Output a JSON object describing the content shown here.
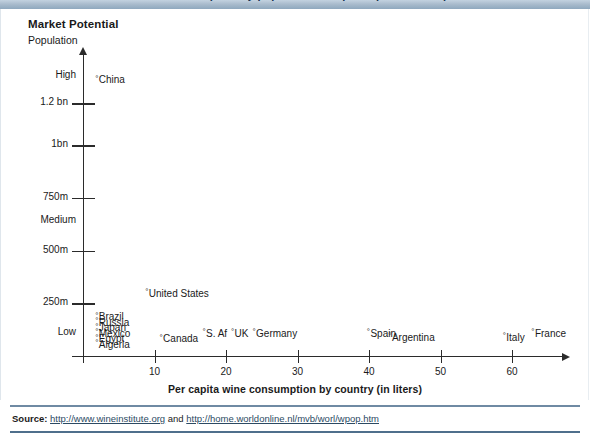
{
  "banner": {
    "clipped_text": "Market Potential for wine consumption by population and per capita consumption"
  },
  "figure": {
    "title": "Market Potential",
    "subtitle": "Population"
  },
  "source": {
    "label": "Source:",
    "url1": "http://www.wineinstitute.org",
    "conjunction": "and",
    "url2": "http://home.worldonline.nl/mvb/worl/wpop.htm"
  },
  "chart_data": {
    "type": "scatter",
    "title": "Market Potential",
    "xlabel": "Per capita wine consumption by country (in liters)",
    "ylabel": "Population",
    "xlim": [
      0,
      68
    ],
    "ylim": [
      0,
      1400
    ],
    "grid": false,
    "legend": null,
    "x_ticks": [
      10,
      20,
      30,
      40,
      50,
      60
    ],
    "x_tick_labels": [
      "10",
      "20",
      "30",
      "40",
      "50",
      "60"
    ],
    "y_ticks": [
      1200,
      1000,
      750,
      500,
      250
    ],
    "y_tick_labels": [
      "1.2 bn",
      "1bn",
      "750m",
      "500m",
      "250m"
    ],
    "y_band_labels": [
      {
        "label": "High",
        "value": 1330
      },
      {
        "label": "Medium",
        "value": 640
      },
      {
        "label": "Low",
        "value": 110
      }
    ],
    "points": [
      {
        "label": "China",
        "x": 1,
        "y": 1300
      },
      {
        "label": "United States",
        "x": 8,
        "y": 285
      },
      {
        "label": "Brazil",
        "x": 1,
        "y": 175
      },
      {
        "label": "Russia",
        "x": 1,
        "y": 148
      },
      {
        "label": "Japan",
        "x": 1,
        "y": 122
      },
      {
        "label": "Mexico",
        "x": 1,
        "y": 96
      },
      {
        "label": "Egypt",
        "x": 1,
        "y": 70
      },
      {
        "label": "Algeria",
        "x": 1,
        "y": 44
      },
      {
        "label": "Canada",
        "x": 10,
        "y": 70
      },
      {
        "label": "S. Af",
        "x": 16,
        "y": 96
      },
      {
        "label": "UK",
        "x": 20,
        "y": 96
      },
      {
        "label": "Germany",
        "x": 23,
        "y": 96
      },
      {
        "label": "Spain",
        "x": 39,
        "y": 96
      },
      {
        "label": "Argentina",
        "x": 42,
        "y": 76
      },
      {
        "label": "Italy",
        "x": 58,
        "y": 76
      },
      {
        "label": "France",
        "x": 62,
        "y": 96
      }
    ],
    "marker_glyph": "°"
  }
}
